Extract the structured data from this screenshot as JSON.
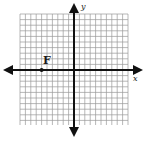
{
  "diagram": {
    "type": "coordinate-plane",
    "grid": {
      "x_min": -10,
      "x_max": 10,
      "y_min": -10,
      "y_max": 10,
      "cells_x": 20,
      "cells_y": 20,
      "grid_color": "#9a9a9a",
      "axis_color": "#111111"
    },
    "axes": {
      "x_label": "x",
      "y_label": "y"
    },
    "points": [
      {
        "label": "F",
        "x": -6,
        "y": 0
      }
    ]
  }
}
